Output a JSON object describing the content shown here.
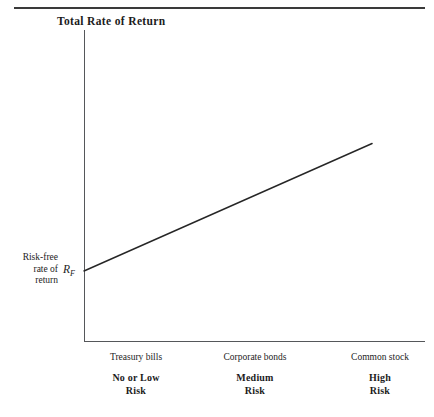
{
  "figure": {
    "title": "Total Rate of Return",
    "y_axis_label_lines": [
      "Risk-free",
      "rate of",
      "return"
    ],
    "risk_free_symbol": {
      "base": "R",
      "subscript": "F"
    },
    "line_color": "#262626",
    "axis_color": "#55575a",
    "rule_color": "#3a3a3a"
  },
  "chart_data": {
    "type": "line",
    "title": "Total Rate of Return",
    "xlabel": "",
    "ylabel": "Total Rate of Return",
    "grid": false,
    "legend": false,
    "categories": [
      "Treasury bills",
      "Corporate bonds",
      "Common stock"
    ],
    "category_risk_labels": [
      [
        "No or Low",
        "Risk"
      ],
      [
        "Medium",
        "Risk"
      ],
      [
        "High",
        "Risk"
      ]
    ],
    "annotations": [
      {
        "text": "Risk-free rate of return",
        "target": "y-intercept"
      },
      {
        "text": "R_F",
        "target": "y-intercept-symbol"
      }
    ],
    "series": [
      {
        "name": "Risk-return tradeoff",
        "points": [
          {
            "x": 0.0,
            "y": 0.225
          },
          {
            "x": 1.0,
            "y": 0.635
          }
        ]
      }
    ],
    "xlim": [
      0,
      1
    ],
    "ylim": [
      0,
      1
    ]
  },
  "x_categories": [
    {
      "instrument": "Treasury bills",
      "risk_line1": "No or Low",
      "risk_line2": "Risk"
    },
    {
      "instrument": "Corporate bonds",
      "risk_line1": "Medium",
      "risk_line2": "Risk"
    },
    {
      "instrument": "Common stock",
      "risk_line1": "High",
      "risk_line2": "Risk"
    }
  ]
}
